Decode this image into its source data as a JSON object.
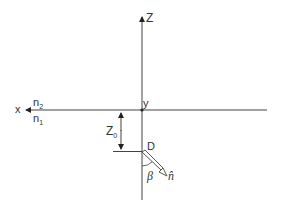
{
  "diagram": {
    "axes": {
      "z_label": "Z",
      "x_label": "x",
      "y_label": "y"
    },
    "media": {
      "upper": {
        "base": "n",
        "sub": "2"
      },
      "lower": {
        "base": "n",
        "sub": "1"
      }
    },
    "depth": {
      "base": "Z",
      "sub": "0"
    },
    "dipole": {
      "label": "D",
      "angle_label": "β",
      "normal_label": "n̂"
    },
    "colors": {
      "line": "#444444",
      "text": "#333333",
      "background": "#ffffff"
    }
  }
}
